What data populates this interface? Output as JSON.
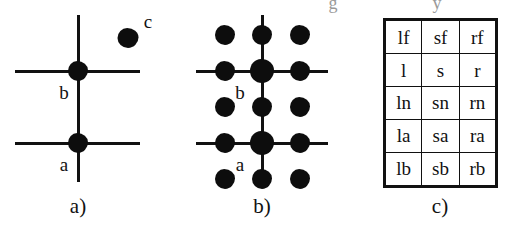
{
  "figure": {
    "background": "#ffffff",
    "ink_color": "#111111",
    "panels": [
      {
        "id": "a",
        "caption": "a)",
        "caption_x": 78,
        "caption_y": 196,
        "description": "Two crossing lines on a vertical axis with nodes a and b, plus an isolated node c",
        "vertical_lines": [
          {
            "x": 78,
            "y1": 15,
            "y2": 182
          }
        ],
        "horizontal_lines": [
          {
            "y": 71,
            "x1": 15,
            "x2": 140
          },
          {
            "y": 143,
            "x1": 15,
            "x2": 140
          }
        ],
        "nodes": [
          {
            "label": "b",
            "x": 78,
            "y": 71,
            "size": 20,
            "label_x": 64,
            "label_y": 92
          },
          {
            "label": "a",
            "x": 78,
            "y": 143,
            "size": 20,
            "label_x": 64,
            "label_y": 164
          },
          {
            "label": "c",
            "x": 128,
            "y": 38,
            "size": 20,
            "label_x": 148,
            "label_y": 21
          }
        ]
      },
      {
        "id": "b",
        "caption": "b)",
        "caption_x": 82,
        "caption_y": 196,
        "description": "Three by five grid of dots with the same crossing lines overlaid",
        "vertical_lines": [
          {
            "x": 82,
            "y1": 15,
            "y2": 186
          }
        ],
        "horizontal_lines": [
          {
            "y": 71,
            "x1": 16,
            "x2": 148
          },
          {
            "y": 143,
            "x1": 16,
            "x2": 148
          }
        ],
        "dot_columns_x": [
          45,
          82,
          120
        ],
        "dot_rows_y": [
          35,
          71,
          107,
          143,
          179
        ],
        "dot_size": 20,
        "junction_dot_size": 24,
        "junction_cells": [
          [
            1,
            1
          ],
          [
            1,
            3
          ]
        ],
        "nodes": [
          {
            "label": "b",
            "x": 82,
            "y": 71,
            "label_x": 60,
            "label_y": 92
          },
          {
            "label": "a",
            "x": 82,
            "y": 143,
            "label_x": 60,
            "label_y": 164
          }
        ]
      },
      {
        "id": "c",
        "caption": "c)",
        "caption_x": 100,
        "caption_y": 196,
        "description": "Three column by five row table of position labels"
      }
    ]
  },
  "table": {
    "columns": 3,
    "rows": [
      [
        "lf",
        "sf",
        "rf"
      ],
      [
        "l",
        "s",
        "r"
      ],
      [
        "ln",
        "sn",
        "rn"
      ],
      [
        "la",
        "sa",
        "ra"
      ],
      [
        "lb",
        "sb",
        "rb"
      ]
    ]
  },
  "scan_artifacts": [
    {
      "text": "g",
      "x": 333,
      "y": -6
    },
    {
      "text": "y",
      "x": 437,
      "y": -6
    }
  ]
}
